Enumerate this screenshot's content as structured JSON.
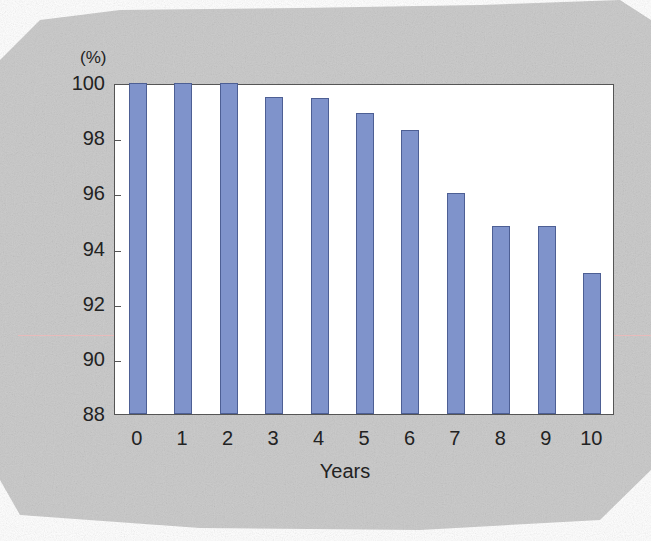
{
  "chart_data": {
    "type": "bar",
    "title": "",
    "xlabel": "Years",
    "ylabel": "(%)",
    "categories": [
      "0",
      "1",
      "2",
      "3",
      "4",
      "5",
      "6",
      "7",
      "8",
      "9",
      "10"
    ],
    "values": [
      100,
      100,
      100,
      99.5,
      99.45,
      98.9,
      98.3,
      96.0,
      94.8,
      94.8,
      93.1
    ],
    "ylim": [
      88,
      100
    ],
    "yticks": [
      88,
      90,
      92,
      94,
      96,
      98,
      100
    ],
    "grid": false,
    "legend": null,
    "bar_color": "#7f93cb"
  }
}
